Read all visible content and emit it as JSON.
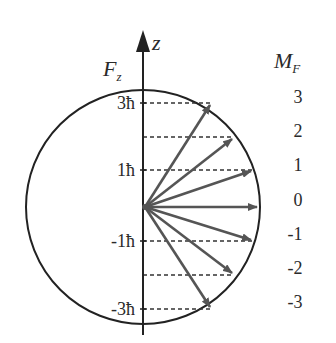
{
  "diagram": {
    "axis": {
      "label": "z",
      "component_label": "F",
      "component_sub": "z"
    },
    "tick_labels": [
      {
        "text": "3ħ",
        "m": 3
      },
      {
        "text": "1ħ",
        "m": 1
      },
      {
        "text": "-1ħ",
        "m": -1
      },
      {
        "text": "-3ħ",
        "m": -3
      }
    ],
    "mf_header": {
      "main": "M",
      "sub": "F"
    },
    "mf_values": [
      "3",
      "2",
      "1",
      "0",
      "-1",
      "-2",
      "-3"
    ],
    "vectors": [
      {
        "m": 3,
        "end": [
          211,
          103
        ]
      },
      {
        "m": 2,
        "end": [
          234,
          137
        ]
      },
      {
        "m": 1,
        "end": [
          253,
          170
        ]
      },
      {
        "m": 0,
        "end": [
          258,
          207
        ]
      },
      {
        "m": -1,
        "end": [
          253,
          241
        ]
      },
      {
        "m": -2,
        "end": [
          234,
          275
        ]
      },
      {
        "m": -3,
        "end": [
          211,
          309
        ]
      }
    ],
    "colors": {
      "line": "#222222",
      "arrow": "#555555",
      "dash": "#333333"
    }
  }
}
